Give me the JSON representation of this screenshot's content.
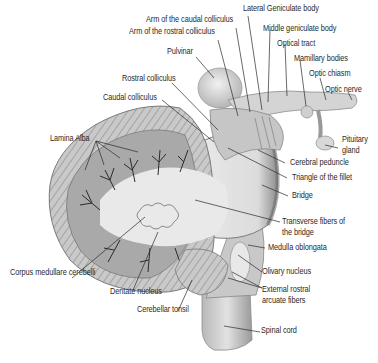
{
  "diagram": {
    "labels": {
      "lateral_geniculate_body": "Lateral Geniculate body",
      "arm_caudal_colliculus": "Arm of the caudal colliculus",
      "middle_geniculate_body": "Middle geniculate body",
      "arm_rostral_colliculus": "Arm of the rostral colliculus",
      "optical_tract": "Optical tract",
      "pulvinar": "Pulvinar",
      "mamillary_bodies": "Mamillary bodies",
      "optic_chiasm": "Optic chiasm",
      "rostral_colliculus": "Rostral colliculus",
      "optic_nerve": "Optic nerve",
      "caudal_colliculus": "Caudal colliculus",
      "pituitary_gland_1": "Pituitary",
      "pituitary_gland_2": "gland",
      "lamina_alba": "Lamina Alba",
      "cerebral_peduncle": "Cerebral peduncle",
      "triangle_fillet": "Triangle of the fillet",
      "bridge": "Bridge",
      "transverse_fibers_1": "Transverse fibers of",
      "transverse_fibers_2": "the bridge",
      "medulla_oblongata": "Medulla oblongata",
      "corpus_medullare": "Corpus medullare cerebelli",
      "olivary_nucleus": "Olivary nucleus",
      "external_rostral_1": "External rostral",
      "external_rostral_2": "arcuate fibers",
      "dentate_nucleus": "Dentate nucleus",
      "cerebellar_tonsil": "Cerebellar tonsil",
      "spinal_cord": "Spinal cord"
    },
    "colors": {
      "tissue_light": "#e6e6e6",
      "tissue_mid": "#bdbdbd",
      "tissue_dark": "#8a8a8a",
      "leader_line": "#2a2a2a",
      "label_text": "#2a2a2a"
    }
  }
}
